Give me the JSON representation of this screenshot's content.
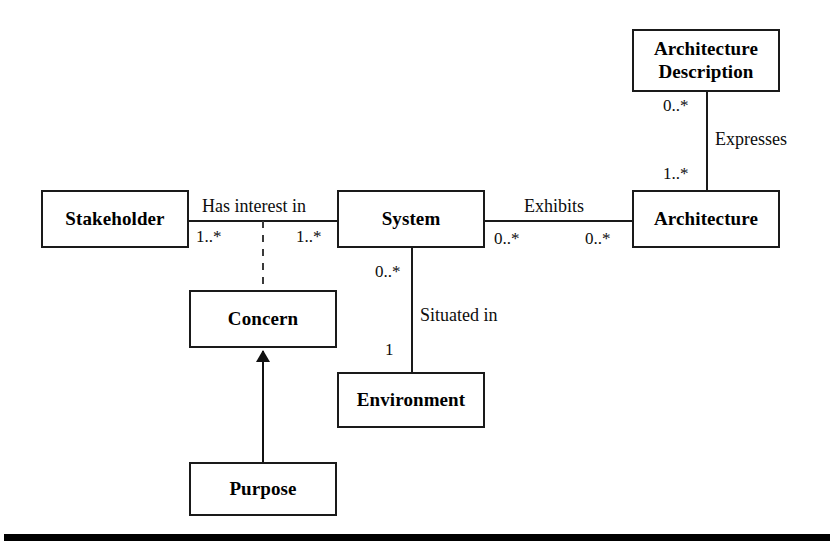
{
  "diagram": {
    "type": "uml-class-diagram",
    "background_color": "#ffffff",
    "stroke_color": "#1a1a1a",
    "text_color": "#000000",
    "nodes": [
      {
        "id": "architecture-description",
        "label": "Architecture\nDescription",
        "x": 632,
        "y": 29,
        "w": 148,
        "h": 63
      },
      {
        "id": "stakeholder",
        "label": "Stakeholder",
        "x": 41,
        "y": 190,
        "w": 148,
        "h": 58
      },
      {
        "id": "system",
        "label": "System",
        "x": 337,
        "y": 190,
        "w": 148,
        "h": 58
      },
      {
        "id": "architecture",
        "label": "Architecture",
        "x": 632,
        "y": 190,
        "w": 148,
        "h": 58
      },
      {
        "id": "concern",
        "label": "Concern",
        "x": 189,
        "y": 290,
        "w": 148,
        "h": 58
      },
      {
        "id": "environment",
        "label": "Environment",
        "x": 337,
        "y": 372,
        "w": 148,
        "h": 56
      },
      {
        "id": "purpose",
        "label": "Purpose",
        "x": 189,
        "y": 462,
        "w": 148,
        "h": 54
      }
    ],
    "edge_labels": [
      {
        "id": "has-interest-in",
        "text": "Has interest in",
        "x": 202,
        "y": 197
      },
      {
        "id": "exhibits",
        "text": "Exhibits",
        "x": 524,
        "y": 197
      },
      {
        "id": "expresses",
        "text": "Expresses",
        "x": 715,
        "y": 130
      },
      {
        "id": "situated-in",
        "text": "Situated in",
        "x": 420,
        "y": 306
      }
    ],
    "multiplicities": [
      {
        "id": "stakeholder-end",
        "text": "1..*",
        "x": 196,
        "y": 228
      },
      {
        "id": "system-stakeholder-end",
        "text": "1..*",
        "x": 296,
        "y": 228
      },
      {
        "id": "system-exhibits-end",
        "text": "0..*",
        "x": 494,
        "y": 230
      },
      {
        "id": "architecture-exhibits-end",
        "text": "0..*",
        "x": 585,
        "y": 230
      },
      {
        "id": "ad-expresses-end",
        "text": "0..*",
        "x": 663,
        "y": 97
      },
      {
        "id": "architecture-expresses-end",
        "text": "1..*",
        "x": 663,
        "y": 165
      },
      {
        "id": "system-situated-end",
        "text": "0..*",
        "x": 375,
        "y": 263
      },
      {
        "id": "environment-situated-end",
        "text": "1",
        "x": 385,
        "y": 341
      }
    ],
    "footer_rule": {
      "x": 4,
      "y": 534,
      "w": 826,
      "h": 7,
      "color": "#000000"
    }
  }
}
